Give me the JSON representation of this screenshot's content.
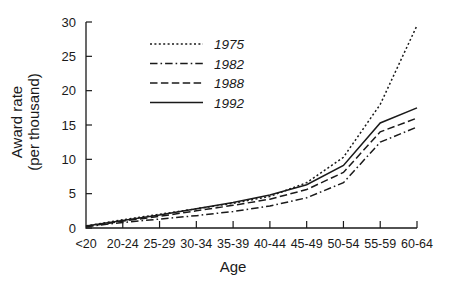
{
  "chart_data": {
    "type": "line",
    "title": "",
    "xlabel": "Age",
    "ylabel": "Award rate\n(per thousand)",
    "ylabel_line1": "Award rate",
    "ylabel_line2": "(per thousand)",
    "categories": [
      "<20",
      "20-24",
      "25-29",
      "30-34",
      "35-39",
      "40-44",
      "45-49",
      "50-54",
      "55-59",
      "60-64"
    ],
    "xlim": [
      0,
      9
    ],
    "ylim": [
      0,
      30
    ],
    "yticks": [
      0,
      5,
      10,
      15,
      20,
      25,
      30
    ],
    "ytick_labels": [
      "0",
      "5",
      "10",
      "15",
      "20",
      "25",
      "30"
    ],
    "grid": false,
    "legend_position": "upper-center-left",
    "series": [
      {
        "name": "1975",
        "dash": "dotted",
        "values": [
          0.3,
          1.2,
          2.0,
          2.8,
          3.6,
          4.6,
          6.6,
          10.3,
          18.0,
          29.5
        ]
      },
      {
        "name": "1982",
        "dash": "dash-dot",
        "values": [
          0.2,
          0.8,
          1.3,
          1.8,
          2.4,
          3.2,
          4.4,
          6.6,
          12.5,
          14.7
        ]
      },
      {
        "name": "1988",
        "dash": "dashed",
        "values": [
          0.2,
          1.0,
          1.7,
          2.5,
          3.3,
          4.2,
          5.6,
          8.1,
          14.0,
          16.0
        ]
      },
      {
        "name": "1992",
        "dash": "solid",
        "values": [
          0.3,
          1.1,
          1.9,
          2.8,
          3.7,
          4.8,
          6.3,
          9.1,
          15.3,
          17.5
        ]
      }
    ]
  },
  "legend": {
    "items": [
      {
        "label": "1975",
        "dash": "dotted"
      },
      {
        "label": "1982",
        "dash": "dash-dot"
      },
      {
        "label": "1988",
        "dash": "dashed"
      },
      {
        "label": "1992",
        "dash": "solid"
      }
    ]
  },
  "colors": {
    "ink": "#1a1a1a",
    "background": "#ffffff"
  }
}
